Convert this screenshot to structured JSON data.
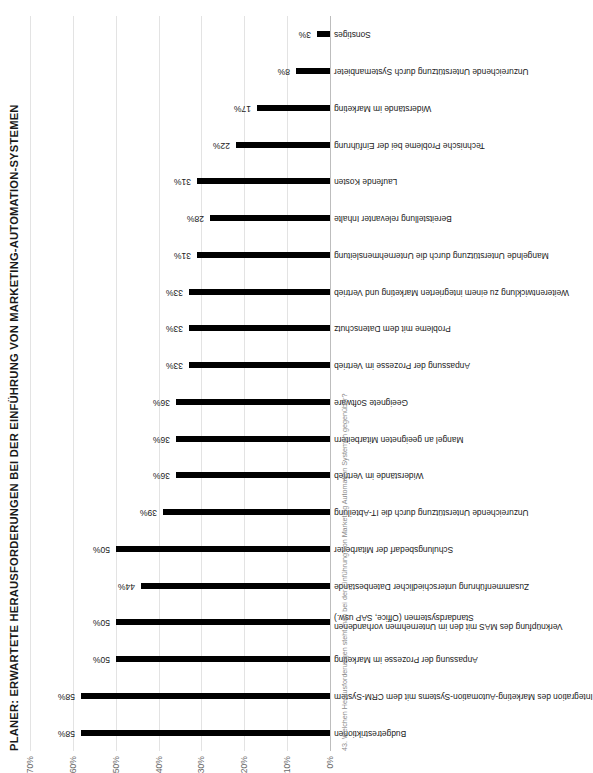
{
  "chart_data": {
    "type": "bar",
    "title": "PLANER: ERWARTETE HERAUSFORDERUNGEN BEI DER EINFÜHRUNG VON MARKETING-AUTOMATION-SYSTEMEN",
    "xlabel": "",
    "ylabel": "",
    "ylim": [
      0,
      70
    ],
    "grid": true,
    "legend": null,
    "orientation": "vertical-rotated",
    "tick_labels": [
      "0%",
      "10%",
      "20%",
      "30%",
      "40%",
      "50%",
      "60%",
      "70%"
    ],
    "tick_values": [
      0,
      10,
      20,
      30,
      40,
      50,
      60,
      70
    ],
    "categories": [
      "Budgetrestriktionen",
      "Integration des Marketing-Automation-Systems mit dem CRM-System",
      "Anpassung der Prozesse im Marketing",
      "Verknüpfung des MAS mit den im Unternehmen vorhandenen\nStandardsystemen (Office, SAP usw.)",
      "Zusammenführung unterschiedlicher Datenbestände",
      "Schulungsbedarf der Mitarbeiter",
      "Unzureichende Unterstützung durch die IT-Abteilung",
      "Widerstände im Vertrieb",
      "Mangel an geeigneten Mitarbeitern",
      "Geeignete Software",
      "Anpassung der Prozesse im Vertrieb",
      "Probleme mit dem Datenschutz",
      "Weiterentwicklung zu einem integrierten Marketing und Vertrieb",
      "Mangelnde Unterstützung durch die Unternehmensleitung",
      "Bereitstellung relevanter Inhalte",
      "Laufende Kosten",
      "Technische Probleme bei der Einführung",
      "Widerstände im Marketing",
      "Unzureichende Unterstützung durch Systemanbieter",
      "Sonstiges"
    ],
    "values": [
      58,
      58,
      50,
      50,
      44,
      50,
      39,
      36,
      36,
      36,
      33,
      33,
      33,
      31,
      28,
      31,
      22,
      17,
      8,
      3
    ],
    "value_labels": [
      "58%",
      "58%",
      "50%",
      "50%",
      "44%",
      "50%",
      "39%",
      "36%",
      "36%",
      "36%",
      "33%",
      "33%",
      "33%",
      "31%",
      "28%",
      "31%",
      "22%",
      "17%",
      "8%",
      "3%"
    ],
    "bar_color": "#000000",
    "grid_color": "#e3e3e3",
    "axis_label_color": "#6b6b6b"
  },
  "footnote": "43. Welchen Herausforderungen steht man bei der Einführung von Marketing Automation Systemen gegenüber?"
}
